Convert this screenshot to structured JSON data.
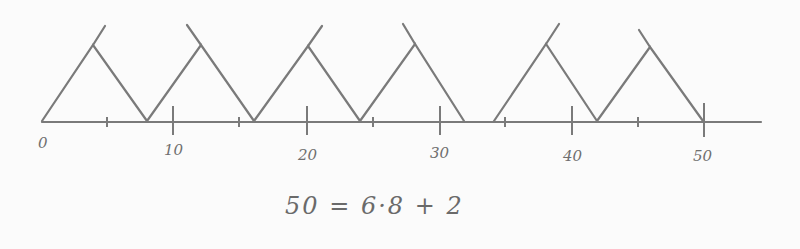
{
  "diagram": {
    "title": "",
    "axis": {
      "start_value": 0,
      "end_value": 50,
      "major_ticks": [
        {
          "value": 0,
          "label": "0"
        },
        {
          "value": 10,
          "label": "10"
        },
        {
          "value": 20,
          "label": "20"
        },
        {
          "value": 30,
          "label": "30"
        },
        {
          "value": 40,
          "label": "40"
        },
        {
          "value": 50,
          "label": "50"
        }
      ],
      "minor_ticks": [
        5,
        15,
        25,
        35,
        45
      ]
    },
    "triangles": [
      {
        "from": 0,
        "to": 8
      },
      {
        "from": 8,
        "to": 16
      },
      {
        "from": 16,
        "to": 24
      },
      {
        "from": 24,
        "to": 32
      },
      {
        "from": 34,
        "to": 42
      },
      {
        "from": 42,
        "to": 50
      }
    ],
    "equation": "50 = 6·8 + 2",
    "ink_color": "#7a7a7a",
    "background_color": "#fbfbfb"
  }
}
